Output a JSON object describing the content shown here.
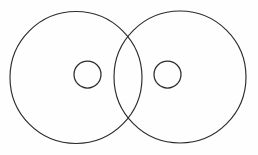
{
  "figure": {
    "background_color": "#fefefe",
    "stroke_color": "#2b2b2b",
    "canvas": {
      "width": 258,
      "height": 155
    }
  },
  "chart_data": {
    "type": "diagram",
    "subtype": "line-drawing",
    "title": "",
    "xlabel": "",
    "ylabel": "",
    "grid": false,
    "legend": "none",
    "units": "pixels",
    "xlim": [
      0,
      258
    ],
    "ylim": [
      0,
      155
    ],
    "shapes": [
      {
        "name": "left-outer-circle",
        "kind": "circle",
        "cx": 76,
        "cy": 77.5,
        "r": 66,
        "stroke": "#2b2b2b",
        "stroke_width": 1.15,
        "fill": "none"
      },
      {
        "name": "right-outer-circle",
        "kind": "circle",
        "cx": 180,
        "cy": 77,
        "r": 66,
        "stroke": "#2b2b2b",
        "stroke_width": 1.15,
        "fill": "none"
      },
      {
        "name": "left-inner-circle",
        "kind": "circle",
        "cx": 87.5,
        "cy": 74.5,
        "r": 13.5,
        "stroke": "#2b2b2b",
        "stroke_width": 1.25,
        "fill": "none"
      },
      {
        "name": "right-inner-circle",
        "kind": "circle",
        "cx": 167.5,
        "cy": 74.5,
        "r": 13.5,
        "stroke": "#2b2b2b",
        "stroke_width": 1.25,
        "fill": "none"
      }
    ],
    "intersections": [
      {
        "name": "upper-lens-point",
        "x": 131,
        "y": 38
      },
      {
        "name": "lower-lens-point",
        "x": 131,
        "y": 113
      }
    ]
  }
}
